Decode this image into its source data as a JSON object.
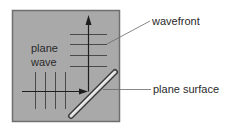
{
  "diagram": {
    "labels": {
      "plane_wave_line1": "plane",
      "plane_wave_line2": "wave",
      "wavefront": "wavefront",
      "plane_surface": "plane surface"
    },
    "colors": {
      "panel_fill": "#a9a9a9",
      "panel_border": "#6f6f6f",
      "line": "#3a3a3a",
      "arrow": "#1e1e1e",
      "surface_dark": "#3c3c3c",
      "surface_light": "#f2f2f2",
      "leader": "#6a6a6a",
      "text": "#2a2a2a"
    }
  }
}
